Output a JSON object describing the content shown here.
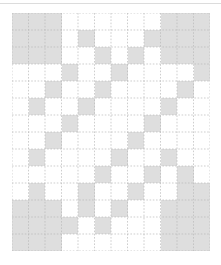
{
  "figure": {
    "background_color": "#ffffff",
    "top_rule_color": "#dcdcdc"
  },
  "grid": {
    "columns": 12,
    "rows": 14,
    "origin_x": 12,
    "origin_y": 13,
    "cell_width": 16.5,
    "cell_height": 17,
    "line_color": "#b9b9b9",
    "line_style": "dotted",
    "line_width": 0.7,
    "fill_color": "#dedede",
    "empty_color": "#ffffff"
  },
  "chart_data": {
    "type": "heatmap",
    "title": "",
    "xlabel": "",
    "ylabel": "",
    "grid": true,
    "legend": "none",
    "ncols": 12,
    "nrows": 14,
    "value_labels": {
      "0": "empty",
      "1": "shaded"
    },
    "matrix": [
      [
        1,
        1,
        1,
        0,
        0,
        0,
        0,
        0,
        0,
        1,
        1,
        1
      ],
      [
        1,
        1,
        1,
        0,
        1,
        0,
        0,
        0,
        1,
        1,
        1,
        1
      ],
      [
        1,
        1,
        1,
        0,
        0,
        1,
        0,
        1,
        0,
        1,
        1,
        1
      ],
      [
        0,
        0,
        0,
        1,
        0,
        0,
        1,
        0,
        0,
        0,
        0,
        1
      ],
      [
        0,
        0,
        1,
        0,
        0,
        1,
        0,
        0,
        0,
        0,
        1,
        0
      ],
      [
        0,
        1,
        0,
        0,
        1,
        0,
        0,
        0,
        0,
        1,
        0,
        0
      ],
      [
        0,
        0,
        0,
        1,
        0,
        0,
        0,
        0,
        1,
        0,
        0,
        0
      ],
      [
        0,
        0,
        1,
        0,
        0,
        0,
        0,
        1,
        0,
        0,
        0,
        0
      ],
      [
        0,
        1,
        0,
        0,
        0,
        0,
        1,
        0,
        0,
        1,
        0,
        0
      ],
      [
        0,
        0,
        0,
        0,
        0,
        1,
        0,
        0,
        1,
        0,
        1,
        0
      ],
      [
        0,
        1,
        0,
        0,
        1,
        0,
        0,
        1,
        0,
        0,
        1,
        1
      ],
      [
        1,
        1,
        1,
        0,
        1,
        0,
        1,
        0,
        0,
        1,
        1,
        1
      ],
      [
        1,
        1,
        1,
        1,
        0,
        1,
        0,
        0,
        0,
        1,
        1,
        1
      ],
      [
        1,
        1,
        1,
        0,
        0,
        0,
        0,
        0,
        0,
        1,
        1,
        1
      ]
    ]
  }
}
